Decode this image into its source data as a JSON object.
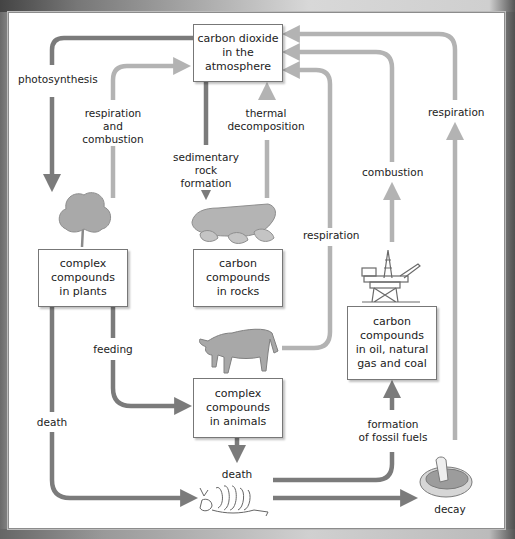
{
  "diagram": {
    "colors": {
      "dark_arrow": "#7b7b7b",
      "light_arrow": "#b3b3b3",
      "box_border": "#777777"
    },
    "nodes": {
      "atmosphere": "carbon dioxide\nin the\natmosphere",
      "plants": "complex\ncompounds\nin plants",
      "rocks": "carbon\ncompounds\nin rocks",
      "fossil": "carbon\ncompounds\nin oil, natural\ngas and coal",
      "animals": "complex\ncompounds\nin animals"
    },
    "labels": {
      "photosynthesis": "photosynthesis",
      "respiration_combustion": "respiration\nand combustion",
      "sedimentary": "sedimentary\nrock formation",
      "thermal": "thermal\ndecomposition",
      "respiration_animals": "respiration",
      "combustion": "combustion",
      "respiration_decay": "respiration",
      "feeding": "feeding",
      "death_plants": "death",
      "death_animals": "death",
      "fossil_formation": "formation\nof fossil fuels",
      "decay": "decay"
    },
    "icons": [
      "tree-icon",
      "rock-icon",
      "cow-icon",
      "oil-rig-icon",
      "skeleton-icon",
      "mushroom-icon"
    ]
  }
}
